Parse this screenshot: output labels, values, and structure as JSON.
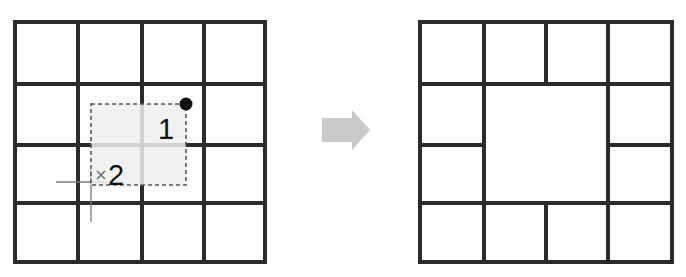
{
  "figure": {
    "type": "diagram",
    "background_color": "#ffffff"
  },
  "arrow": {
    "icon": "right-arrow-icon",
    "color": "#c9c9c9",
    "direction": "right",
    "x": 322,
    "y": 110,
    "width": 48,
    "height": 40
  },
  "before": {
    "name": "before-grid",
    "grid": {
      "rows": 4,
      "cols": 4,
      "x": 15,
      "y": 22,
      "width": 250,
      "height": 240,
      "col_edges": [
        15,
        78,
        142,
        204,
        265
      ],
      "row_edges": [
        22,
        84,
        145,
        203,
        262
      ],
      "line_color": "#2b2b2b",
      "line_width": 4
    },
    "selection": {
      "name": "drag-selection-rect",
      "x": 91,
      "y": 104,
      "width": 95,
      "height": 81,
      "fill": "#eeeeee",
      "stroke": "#555555",
      "dashed": true
    },
    "markers": [
      {
        "name": "drag-start-handle",
        "icon": "filled-dot-icon",
        "label": "1",
        "point_x": 186,
        "point_y": 104,
        "label_x": 158,
        "label_y": 138,
        "color": "#111111"
      },
      {
        "name": "drag-end-handle",
        "icon": "cross-mark-icon",
        "label": "2",
        "point_x": 101,
        "point_y": 175,
        "label_x": 109,
        "label_y": 184,
        "color": "#6e6e6e"
      }
    ],
    "crosshair": {
      "name": "pointer-crosshair",
      "horizontal": {
        "x1": 56,
        "y1": 182,
        "x2": 124,
        "y2": 182
      },
      "vertical": {
        "x1": 91,
        "y1": 170,
        "x2": 91,
        "y2": 222
      },
      "color": "#7a7a7a"
    }
  },
  "after": {
    "name": "after-grid",
    "grid": {
      "rows": 4,
      "cols": 4,
      "x": 420,
      "y": 22,
      "width": 252,
      "height": 240,
      "col_edges": [
        420,
        484,
        546,
        608,
        672
      ],
      "row_edges": [
        22,
        84,
        145,
        203,
        262
      ],
      "line_color": "#2b2b2b",
      "line_width": 4
    },
    "merged_cell": {
      "name": "merged-cell",
      "start_row": 2,
      "start_col": 2,
      "row_span": 2,
      "col_span": 2,
      "x": 484,
      "y": 84,
      "width": 124,
      "height": 119
    }
  }
}
